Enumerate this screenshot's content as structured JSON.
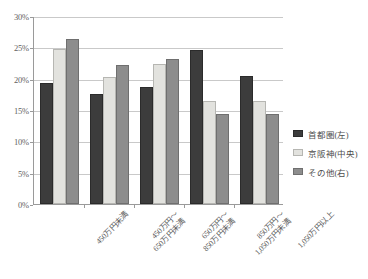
{
  "chart_data": {
    "type": "bar",
    "title": "",
    "subtitle": "",
    "xlabel": "",
    "ylabel": "",
    "categories": [
      "450万円未満",
      "450万円～\n650万円未満",
      "650万円～\n850万円未満",
      "850万円～\n1,050万円未満",
      "1,050万円以上"
    ],
    "series": [
      {
        "name": "首都圏(左)",
        "color": "#3c3c3c",
        "values": [
          19.3,
          17.5,
          18.7,
          24.5,
          20.4
        ]
      },
      {
        "name": "京阪神(中央)",
        "color": "#e2e2de",
        "values": [
          24.8,
          20.3,
          22.3,
          16.5,
          16.5
        ]
      },
      {
        "name": "その他(右)",
        "color": "#8d8d8d",
        "values": [
          26.3,
          22.2,
          23.2,
          14.4,
          14.4
        ]
      }
    ],
    "ylim": [
      0,
      30
    ],
    "ytick_labels": [
      "0%",
      "5%",
      "10%",
      "15%",
      "20%",
      "25%",
      "30%"
    ],
    "ytick_values": [
      0,
      5,
      10,
      15,
      20,
      25,
      30
    ],
    "grid": true,
    "legend_position": "right"
  },
  "legend": {
    "items": [
      {
        "label": "首都圏(左)"
      },
      {
        "label": "京阪神(中央)"
      },
      {
        "label": "その他(右)"
      }
    ]
  }
}
